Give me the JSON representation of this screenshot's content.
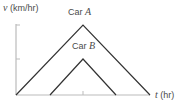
{
  "axes": {
    "y_label_var": "v",
    "y_label_unit": "(km/hr)",
    "x_label_var": "t",
    "x_label_unit": "(hr)"
  },
  "curves": [
    {
      "name_prefix": "Car ",
      "name_var": "A",
      "color": "#333333"
    },
    {
      "name_prefix": "Car ",
      "name_var": "B",
      "color": "#333333"
    }
  ],
  "colors": {
    "axis": "#bbbbbb",
    "line": "#333333",
    "text": "#4a4a4a"
  }
}
